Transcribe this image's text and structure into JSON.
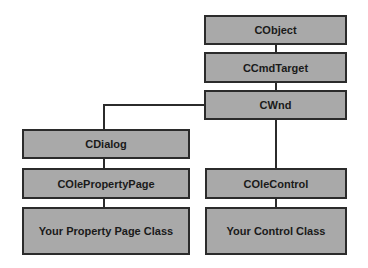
{
  "diagram": {
    "nodes": [
      {
        "id": "cobject",
        "label": "CObject"
      },
      {
        "id": "ccmdtarget",
        "label": "CCmdTarget"
      },
      {
        "id": "cwnd",
        "label": "CWnd"
      },
      {
        "id": "cdialog",
        "label": "CDialog"
      },
      {
        "id": "colepropertypage",
        "label": "COlePropertyPage"
      },
      {
        "id": "your_property_page",
        "label": "Your Property Page Class"
      },
      {
        "id": "colecontrol",
        "label": "COleControl"
      },
      {
        "id": "your_control",
        "label": "Your Control Class"
      }
    ],
    "edges": [
      [
        "cobject",
        "ccmdtarget"
      ],
      [
        "ccmdtarget",
        "cwnd"
      ],
      [
        "cwnd",
        "cdialog"
      ],
      [
        "cdialog",
        "colepropertypage"
      ],
      [
        "colepropertypage",
        "your_property_page"
      ],
      [
        "cwnd",
        "colecontrol"
      ],
      [
        "colecontrol",
        "your_control"
      ]
    ],
    "colors": {
      "box_fill": "#a9a9a9",
      "box_border": "#2b2b2b",
      "line": "#2b2b2b",
      "background": "#ffffff"
    }
  }
}
